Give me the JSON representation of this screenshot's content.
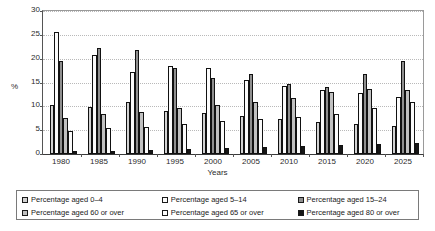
{
  "chart_data": {
    "type": "bar",
    "title": "",
    "xlabel": "Years",
    "ylabel": "%",
    "ylim": [
      0,
      30
    ],
    "yticks": [
      0,
      5,
      10,
      15,
      20,
      25,
      30
    ],
    "grid": true,
    "legend_position": "bottom",
    "categories": [
      "1980",
      "1985",
      "1990",
      "1995",
      "2000",
      "2005",
      "2010",
      "2015",
      "2020",
      "2025"
    ],
    "series": [
      {
        "name": "Percentage aged 0–4",
        "color": "#d2d2d2",
        "values": [
          10.2,
          9.9,
          11.0,
          9.1,
          8.5,
          8.0,
          7.4,
          6.7,
          6.2,
          5.8
        ]
      },
      {
        "name": "Percentage aged 5–14",
        "color": "#fbfbfb",
        "values": [
          25.6,
          20.8,
          17.3,
          18.5,
          18.1,
          15.5,
          14.2,
          13.4,
          12.7,
          12.0
        ]
      },
      {
        "name": "Percentage aged 15–24",
        "color": "#8f8f8f",
        "values": [
          19.5,
          22.2,
          21.8,
          18.0,
          15.9,
          16.7,
          14.7,
          14.0,
          16.8,
          19.6
        ]
      },
      {
        "name": "Percentage aged 60 or over",
        "color": "#c0c0c0",
        "values": [
          7.6,
          8.4,
          8.8,
          9.6,
          10.3,
          11.0,
          11.8,
          13.1,
          13.6,
          13.4
        ]
      },
      {
        "name": "Percentage aged 65 or over",
        "color": "#fbfbfb",
        "values": [
          4.9,
          5.4,
          5.6,
          6.2,
          6.9,
          7.3,
          7.7,
          8.4,
          9.6,
          11.0
        ]
      },
      {
        "name": "Percentage aged 80 or over",
        "color": "#161616",
        "values": [
          0.6,
          0.7,
          0.8,
          1.0,
          1.2,
          1.4,
          1.6,
          1.8,
          2.1,
          2.4
        ]
      }
    ]
  },
  "legend": {
    "items": [
      "Percentage aged 0–4",
      "Percentage aged 5–14",
      "Percentage aged 15–24",
      "Percentage aged 60 or over",
      "Percentage aged 65 or over",
      "Percentage aged 80 or over"
    ]
  }
}
